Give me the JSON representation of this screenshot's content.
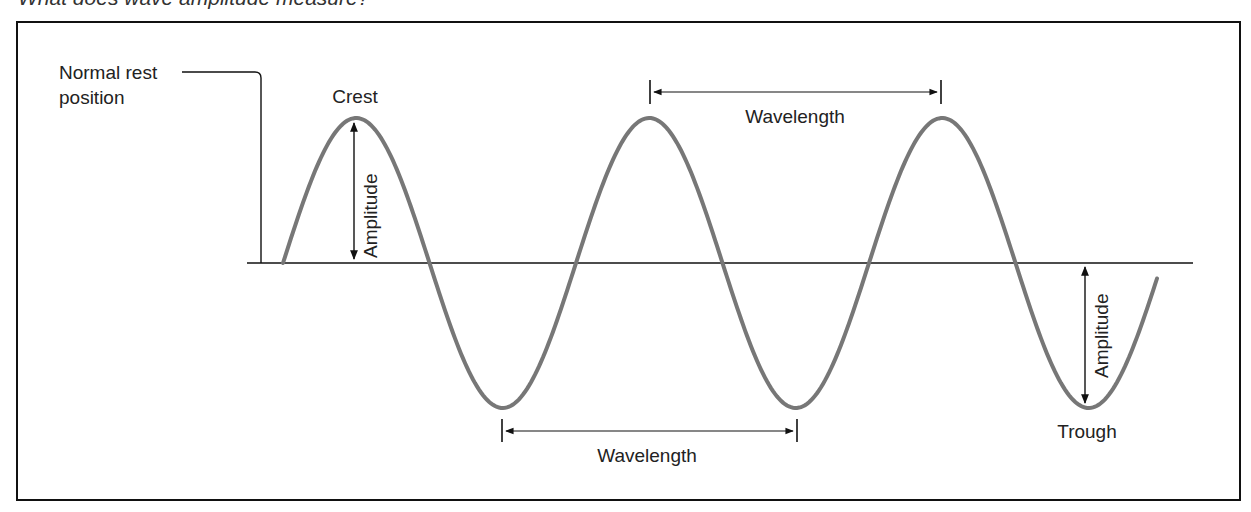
{
  "caption": "What does wave amplitude measure?",
  "diagram": {
    "labels": {
      "crest": "Crest",
      "trough": "Trough",
      "rest_position": [
        "Normal rest",
        "position"
      ],
      "amplitude_top": "Amplitude",
      "amplitude_bottom": "Amplitude",
      "wavelength_top": "Wavelength",
      "wavelength_bottom": "Wavelength"
    },
    "colors": {
      "wave": "#777777",
      "lines": "#111111",
      "text": "#222222"
    },
    "geometry": {
      "baseline_y": 263,
      "crest_y": 118,
      "trough_y": 408,
      "crest_x": [
        354,
        648,
        940
      ],
      "trough_x": [
        504,
        795,
        1085
      ]
    }
  }
}
